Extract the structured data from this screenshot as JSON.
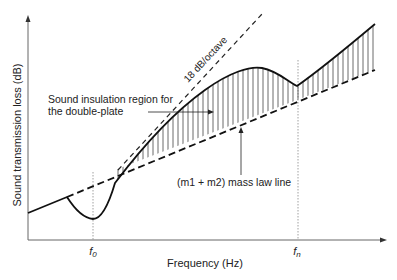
{
  "diagram": {
    "title": "",
    "y_axis_label": "Sound transmission loss (dB)",
    "x_axis_label": "Frequency (Hz)",
    "x_ticks": [
      {
        "label": "f0",
        "sub": "0",
        "base": "f",
        "x": 93
      },
      {
        "label": "fn",
        "sub": "n",
        "base": "f",
        "x": 298
      }
    ],
    "annotations": {
      "slope_label": "18 dB/octave",
      "region_label_line1": "Sound insulation region for",
      "region_label_line2": "the double-plate",
      "mass_law_label": "(m1 + m2) mass law line"
    },
    "colors": {
      "curve": "#111111",
      "hatch": "#444444",
      "axis": "#555555",
      "text": "#222222"
    }
  }
}
